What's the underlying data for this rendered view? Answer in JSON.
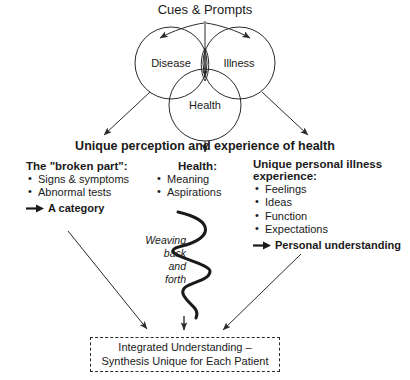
{
  "diagram": {
    "top_title": "Cues & Prompts",
    "venn": {
      "circles": [
        {
          "id": "disease",
          "label": "Disease"
        },
        {
          "id": "illness",
          "label": "Illness"
        },
        {
          "id": "health",
          "label": "Health"
        }
      ]
    },
    "banner": "Unique perception and experience of health",
    "columns": {
      "left": {
        "heading": "The \"broken part\":",
        "bullets": [
          "Signs &\nsymptoms",
          "Abnormal tests"
        ],
        "conclusion": "A category"
      },
      "middle": {
        "heading": "Health:",
        "bullets": [
          "Meaning",
          "Aspirations"
        ]
      },
      "right": {
        "heading": "Unique personal illness\nexperience:",
        "bullets": [
          "Feelings",
          "Ideas",
          "Function",
          "Expectations"
        ],
        "conclusion": "Personal understanding"
      }
    },
    "weaving_label": "Weaving\nback\nand\nforth",
    "outcome_box": {
      "line1": "Integrated Understanding –",
      "line2": "Synthesis Unique for Each Patient"
    },
    "colors": {
      "stroke": "#2b2b2b",
      "text": "#1a1a1a",
      "background": "#ffffff"
    }
  }
}
